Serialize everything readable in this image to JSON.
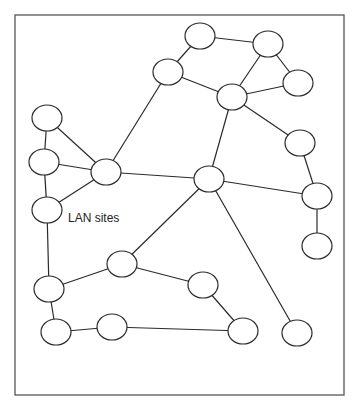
{
  "diagram": {
    "title_label": "LAN sites",
    "label_pos": {
      "x": 68,
      "y": 211
    },
    "frame": {
      "x": 15,
      "y": 15,
      "w": 329,
      "h": 380
    },
    "colors": {
      "stroke": "#2a2a2a",
      "frame": "#555555",
      "node_fill": "#ffffff"
    },
    "node_radius": {
      "rx": 15,
      "ry": 13
    },
    "nodes": [
      {
        "id": "n1",
        "x": 47,
        "y": 118
      },
      {
        "id": "n2",
        "x": 44,
        "y": 162
      },
      {
        "id": "n3",
        "x": 47,
        "y": 210
      },
      {
        "id": "n4",
        "x": 106,
        "y": 172
      },
      {
        "id": "n5",
        "x": 168,
        "y": 72
      },
      {
        "id": "n6",
        "x": 200,
        "y": 36
      },
      {
        "id": "n7",
        "x": 268,
        "y": 44
      },
      {
        "id": "n8",
        "x": 298,
        "y": 83
      },
      {
        "id": "n9",
        "x": 232,
        "y": 97
      },
      {
        "id": "n10",
        "x": 300,
        "y": 143
      },
      {
        "id": "n11",
        "x": 209,
        "y": 179
      },
      {
        "id": "n12",
        "x": 317,
        "y": 196
      },
      {
        "id": "n13",
        "x": 317,
        "y": 246
      },
      {
        "id": "n14",
        "x": 49,
        "y": 289
      },
      {
        "id": "n15",
        "x": 122,
        "y": 264
      },
      {
        "id": "n16",
        "x": 56,
        "y": 332
      },
      {
        "id": "n17",
        "x": 112,
        "y": 327
      },
      {
        "id": "n18",
        "x": 203,
        "y": 285
      },
      {
        "id": "n19",
        "x": 243,
        "y": 331
      },
      {
        "id": "n20",
        "x": 297,
        "y": 333
      }
    ],
    "edges": [
      [
        "n1",
        "n2"
      ],
      [
        "n1",
        "n4"
      ],
      [
        "n2",
        "n4"
      ],
      [
        "n2",
        "n3"
      ],
      [
        "n3",
        "n4"
      ],
      [
        "n3",
        "n14"
      ],
      [
        "n4",
        "n5"
      ],
      [
        "n4",
        "n11"
      ],
      [
        "n5",
        "n6"
      ],
      [
        "n5",
        "n9"
      ],
      [
        "n6",
        "n7"
      ],
      [
        "n7",
        "n9"
      ],
      [
        "n7",
        "n8"
      ],
      [
        "n8",
        "n9"
      ],
      [
        "n9",
        "n10"
      ],
      [
        "n9",
        "n11"
      ],
      [
        "n10",
        "n12"
      ],
      [
        "n11",
        "n12"
      ],
      [
        "n12",
        "n13"
      ],
      [
        "n11",
        "n15"
      ],
      [
        "n11",
        "n20"
      ],
      [
        "n14",
        "n15"
      ],
      [
        "n14",
        "n16"
      ],
      [
        "n16",
        "n17"
      ],
      [
        "n15",
        "n18"
      ],
      [
        "n18",
        "n19"
      ],
      [
        "n17",
        "n19"
      ]
    ]
  }
}
